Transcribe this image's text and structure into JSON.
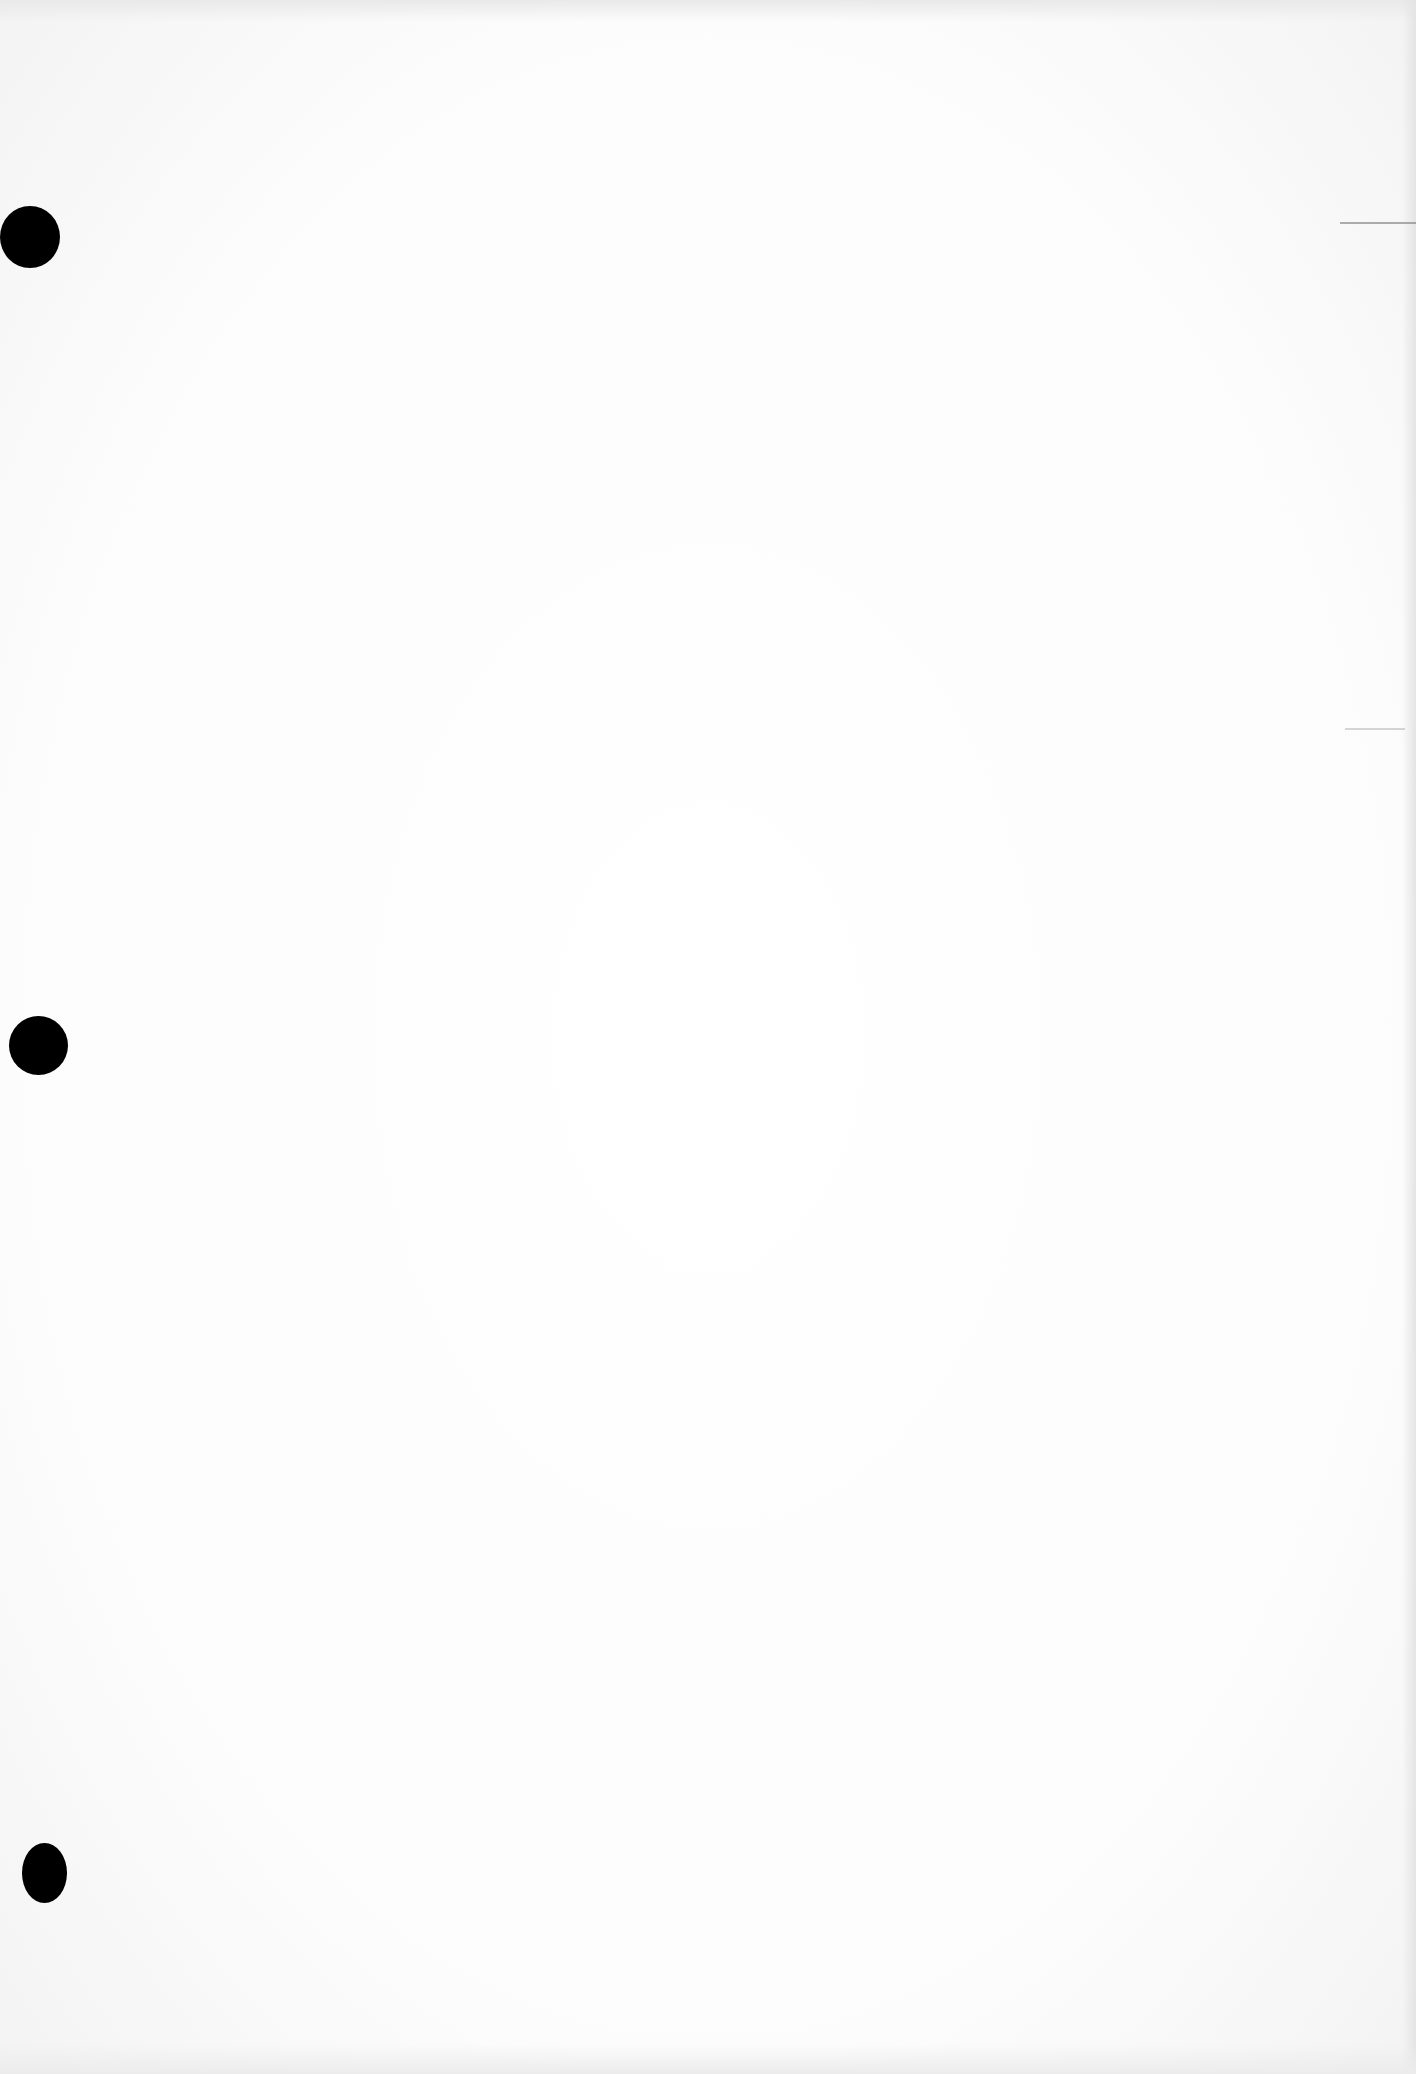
{
  "document": {
    "type": "blank scanned page",
    "text": "",
    "background_color": "#fdfdfd"
  },
  "punch_holes": [
    {
      "name": "punch-hole-top",
      "cx": 30,
      "cy": 236,
      "rx": 30,
      "ry": 30,
      "color": "#000000"
    },
    {
      "name": "punch-hole-middle",
      "cx": 38,
      "cy": 1045,
      "rx": 30,
      "ry": 30,
      "color": "#000000"
    },
    {
      "name": "punch-hole-bottom",
      "cx": 52,
      "cy": 1873,
      "rx": 30,
      "ry": 30,
      "color": "#000000"
    }
  ],
  "scan_marks": [
    {
      "x": 1340,
      "y": 222,
      "width": 76
    },
    {
      "x": 1345,
      "y": 728,
      "width": 60
    }
  ]
}
